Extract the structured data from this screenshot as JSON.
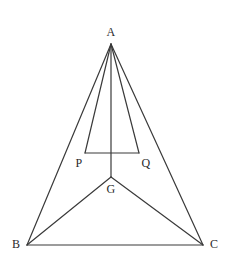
{
  "figure": {
    "width": 234,
    "height": 264,
    "background_color": "#ffffff",
    "stroke_color": "#3a3a3a",
    "stroke_width": 1.2,
    "label_color": "#2b2b2b"
  },
  "points": {
    "A": {
      "label": "A",
      "x": 111,
      "y": 44,
      "label_x": 111,
      "label_y": 32
    },
    "B": {
      "label": "B",
      "x": 27,
      "y": 245,
      "label_x": 16,
      "label_y": 244
    },
    "C": {
      "label": "C",
      "x": 203,
      "y": 245,
      "label_x": 214,
      "label_y": 244
    },
    "G": {
      "label": "G",
      "x": 111,
      "y": 177,
      "label_x": 111,
      "label_y": 189
    },
    "P": {
      "label": "P",
      "x": 85,
      "y": 153,
      "label_x": 79,
      "label_y": 163
    },
    "Q": {
      "label": "Q",
      "x": 139,
      "y": 153,
      "label_x": 146,
      "label_y": 163
    }
  },
  "segments": [
    {
      "name": "AB",
      "from": "A",
      "to": "B"
    },
    {
      "name": "AC",
      "from": "A",
      "to": "C"
    },
    {
      "name": "BC",
      "from": "B",
      "to": "C"
    },
    {
      "name": "AP",
      "from": "A",
      "to": "P"
    },
    {
      "name": "AQ",
      "from": "A",
      "to": "Q"
    },
    {
      "name": "PQ",
      "from": "P",
      "to": "Q"
    },
    {
      "name": "AG",
      "from": "A",
      "to": "G"
    },
    {
      "name": "GB",
      "from": "G",
      "to": "B"
    },
    {
      "name": "GC",
      "from": "G",
      "to": "C"
    }
  ]
}
